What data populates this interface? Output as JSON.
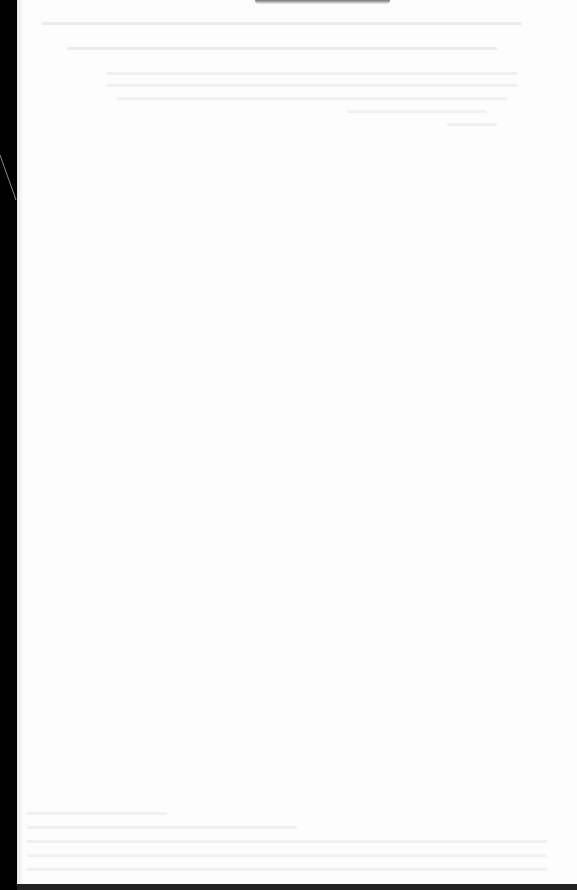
{
  "document": {
    "type": "photographed printed page",
    "legibility": "overexposed; text not legible",
    "colors": {
      "page": "#fdfdfd",
      "background": "#000000",
      "text_traces": "#ececec"
    },
    "regions": [
      {
        "name": "header-text-block",
        "lines": 2
      },
      {
        "name": "table-like-block",
        "lines": 4
      },
      {
        "name": "footer-text-block",
        "lines": 5
      }
    ]
  }
}
